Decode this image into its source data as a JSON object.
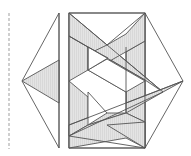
{
  "diagram": {
    "type": "geometric-fold-pattern",
    "colors": {
      "stroke": "#555555",
      "shade": "#d9d9d9",
      "fold_line": "#b0b0b0",
      "background": "#ffffff"
    },
    "elements": [
      {
        "name": "fold-line",
        "style": "dashed"
      },
      {
        "name": "left-flap",
        "shape": "triangle"
      },
      {
        "name": "left-flap-shaded",
        "shape": "triangle"
      },
      {
        "name": "central-rectangle",
        "shape": "rectangle"
      },
      {
        "name": "right-flap",
        "shape": "triangle"
      },
      {
        "name": "woven-bands",
        "count": 3
      },
      {
        "name": "center-block",
        "shape": "isometric-prism"
      }
    ]
  }
}
